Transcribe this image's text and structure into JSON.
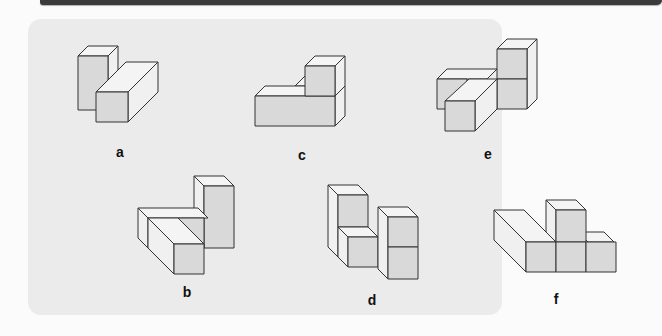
{
  "figures": [
    {
      "id": "a",
      "label": "a",
      "row": 1,
      "col": 1
    },
    {
      "id": "c",
      "label": "c",
      "row": 1,
      "col": 2
    },
    {
      "id": "e",
      "label": "e",
      "row": 1,
      "col": 3
    },
    {
      "id": "b",
      "label": "b",
      "row": 2,
      "col": 1
    },
    {
      "id": "d",
      "label": "d",
      "row": 2,
      "col": 2
    },
    {
      "id": "f",
      "label": "f",
      "row": 2,
      "col": 3
    }
  ],
  "colors": {
    "panel_background": "#ebebeb",
    "front_face": "#d9d9d9",
    "top_face": "#f4f4f4",
    "side_face": "#f0f0f0",
    "edge": "#333333",
    "top_bar": "#3a3a3a"
  }
}
